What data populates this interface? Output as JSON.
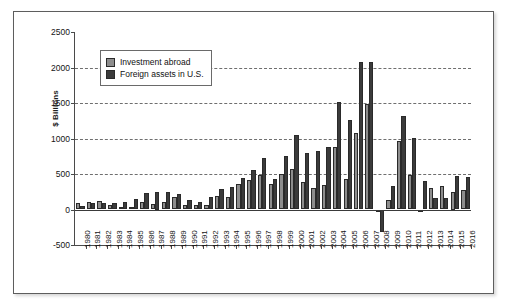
{
  "chart_data": {
    "type": "bar",
    "title": "",
    "xlabel": "",
    "ylabel": "$ Billions",
    "ylim": [
      -500,
      2500
    ],
    "yticks": [
      -500,
      0,
      500,
      1000,
      1500,
      2000,
      2500
    ],
    "ytick_labels": [
      "-500",
      "0",
      "500",
      "1000",
      "1500",
      "2000",
      "2500"
    ],
    "grid": "horizontal-dashed",
    "legend_position": "upper-left-inside",
    "categories": [
      "1980",
      "1981",
      "1982",
      "1983",
      "1984",
      "1985",
      "1986",
      "1987",
      "1988",
      "1989",
      "1990",
      "1991",
      "1992",
      "1993",
      "1994",
      "1995",
      "1996",
      "1997",
      "1998",
      "1999",
      "2000",
      "2001",
      "2002",
      "2003",
      "2004",
      "2005",
      "2006",
      "2007",
      "2008",
      "2009",
      "2010",
      "2011",
      "2012",
      "2013",
      "2014",
      "2015",
      "2016"
    ],
    "series": [
      {
        "name": "Investment abroad",
        "color": "#8d8d8d",
        "values": [
          86,
          110,
          120,
          65,
          40,
          40,
          100,
          75,
          105,
          170,
          60,
          60,
          70,
          195,
          180,
          365,
          415,
          490,
          360,
          505,
          565,
          385,
          305,
          340,
          880,
          435,
          1080,
          1480,
          0,
          130,
          960,
          485,
          -5,
          305,
          330,
          250,
          280
        ]
      },
      {
        "name": "Foreign assets in U.S.",
        "color": "#3b3b3b",
        "values": [
          55,
          85,
          95,
          85,
          110,
          145,
          230,
          250,
          245,
          225,
          140,
          110,
          170,
          285,
          315,
          445,
          555,
          720,
          430,
          755,
          1050,
          795,
          820,
          885,
          1515,
          1265,
          2080,
          2080,
          -320,
          335,
          1320,
          1010,
          405,
          165,
          160,
          475,
          460
        ]
      }
    ]
  },
  "legend": {
    "items": [
      {
        "label": "Investment abroad"
      },
      {
        "label": "Foreign assets in U.S."
      }
    ]
  }
}
